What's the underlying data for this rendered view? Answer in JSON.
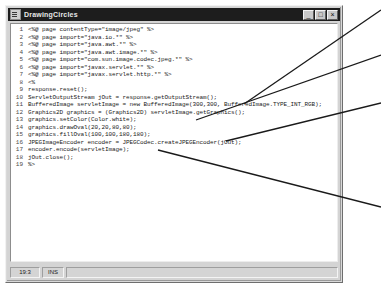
{
  "window": {
    "title": "DrawingCircles",
    "icon": "document-icon",
    "controls": [
      {
        "name": "minimize",
        "glyph": "_"
      },
      {
        "name": "maximize",
        "glyph": "□"
      },
      {
        "name": "close",
        "glyph": "×"
      }
    ]
  },
  "editor": {
    "line_numbers": [
      "1",
      "2",
      "3",
      "4",
      "5",
      "6",
      "7",
      "8",
      "9",
      "10",
      "11",
      "12",
      "13",
      "14",
      "15",
      "16",
      "17",
      "18",
      "19"
    ],
    "lines": [
      "<%@ page contentType=\"image/jpeg\" %>",
      "<%@ page import=\"java.io.*\" %>",
      "<%@ page import=\"java.awt.*\" %>",
      "<%@ page import=\"java.awt.image.*\" %>",
      "<%@ page import=\"com.sun.image.codec.jpeg.*\" %>",
      "<%@ page import=\"javax.servlet.*\" %>",
      "<%@ page import=\"javax.servlet.http.*\" %>",
      "<%",
      "response.reset();",
      "ServletOutputStream jOut = response.getOutputStream();",
      "BufferedImage servletImage = new BufferedImage(300,300, BufferedImage.TYPE_INT_RGB);",
      "Graphics2D graphics = (Graphics2D) servletImage.getGraphics();",
      "graphics.setColor(Color.white);",
      "graphics.drawOval(20,20,80,80);",
      "graphics.fillOval(100,100,180,180);",
      "JPEGImageEncoder encoder = JPEGCodec.createJPEGEncoder(jOut);",
      "encoder.encode(servletImage);",
      "jOut.close();",
      "%>"
    ]
  },
  "statusbar": {
    "position": "19:3",
    "insert_mode": "INS",
    "filler": ""
  },
  "annotations": {
    "description": "callout leader lines pointing from code to right margin",
    "lines": [
      {
        "name": "leader-line-1",
        "x1": 244,
        "y1": 104,
        "x2": 381,
        "y2": 10
      },
      {
        "name": "leader-line-2",
        "x1": 196,
        "y1": 120,
        "x2": 381,
        "y2": 55
      },
      {
        "name": "leader-line-3",
        "x1": 226,
        "y1": 141,
        "x2": 381,
        "y2": 103
      },
      {
        "name": "leader-line-4",
        "x1": 158,
        "y1": 150,
        "x2": 381,
        "y2": 207
      }
    ],
    "color": "#1a1a1a"
  }
}
